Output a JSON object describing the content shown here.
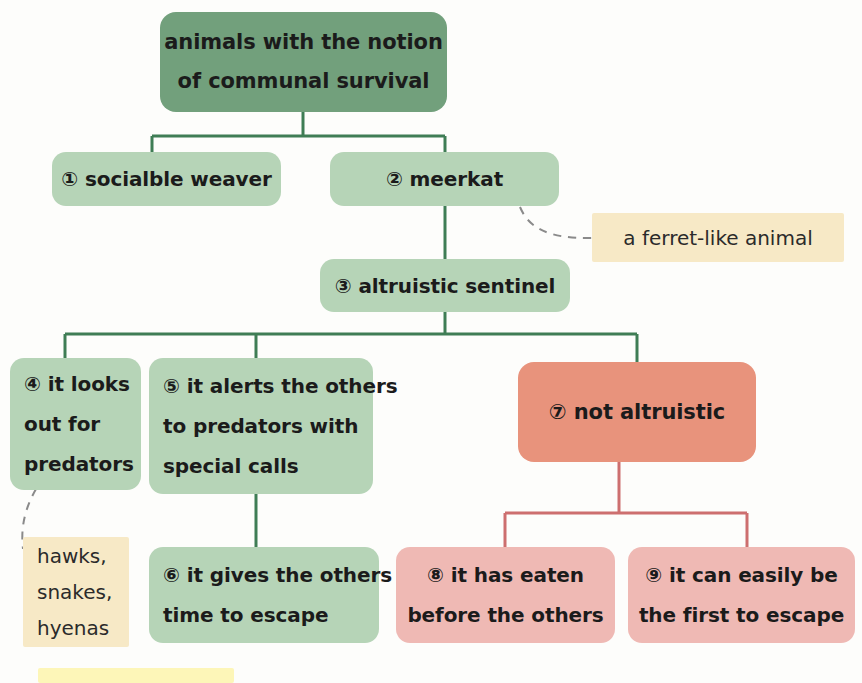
{
  "diagram": {
    "title_node": {
      "id": "root",
      "lines": [
        "animals with the notion",
        "of communal survival"
      ]
    },
    "nodes": [
      {
        "id": "n1",
        "number": "①",
        "lines": [
          "① socialble weaver"
        ],
        "color": "#b6d4b7"
      },
      {
        "id": "n2",
        "number": "②",
        "lines": [
          "② meerkat"
        ],
        "color": "#b6d4b7"
      },
      {
        "id": "n3",
        "number": "③",
        "lines": [
          "③ altruistic sentinel"
        ],
        "color": "#b6d4b7"
      },
      {
        "id": "n4",
        "number": "④",
        "lines": [
          "④ it looks",
          "out for",
          "predators"
        ],
        "color": "#b6d4b7"
      },
      {
        "id": "n5",
        "number": "⑤",
        "lines": [
          "⑤ it alerts the others",
          "to predators with",
          "special calls"
        ],
        "color": "#b6d4b7"
      },
      {
        "id": "n6",
        "number": "⑥",
        "lines": [
          "⑥ it gives the others",
          "time to escape"
        ],
        "color": "#b6d4b7"
      },
      {
        "id": "n7",
        "number": "⑦",
        "lines": [
          "⑦ not altruistic"
        ],
        "color": "#e8937c"
      },
      {
        "id": "n8",
        "number": "⑧",
        "lines": [
          "⑧ it has eaten",
          "before the others"
        ],
        "color": "#efb9b4"
      },
      {
        "id": "n9",
        "number": "⑨",
        "lines": [
          "⑨ it can easily be",
          "the first to escape"
        ],
        "color": "#efb9b4"
      }
    ],
    "notes": [
      {
        "id": "note-ferret",
        "lines": [
          "a ferret-like animal"
        ],
        "color": "#f7e9c6"
      },
      {
        "id": "note-predators",
        "lines": [
          "hawks,",
          "snakes,",
          "hyenas"
        ],
        "color": "#f7e9c6"
      }
    ],
    "colors": {
      "root_green": "#72a07c",
      "light_green": "#b6d4b7",
      "salmon": "#e8937c",
      "pink": "#efb9b4",
      "cream": "#f7e9c6",
      "yellow": "#fdf6b8",
      "green_edge": "#3f7d55",
      "red_edge": "#cd6f6f",
      "dashed_edge": "#8a8a8a",
      "background": "#fdfdfb"
    },
    "edges": [
      {
        "from": "root",
        "to": "n1",
        "style": "solid",
        "color": "#3f7d55"
      },
      {
        "from": "root",
        "to": "n2",
        "style": "solid",
        "color": "#3f7d55"
      },
      {
        "from": "n2",
        "to": "n3",
        "style": "solid",
        "color": "#3f7d55"
      },
      {
        "from": "n2",
        "to": "note-ferret",
        "style": "dashed",
        "color": "#8a8a8a"
      },
      {
        "from": "n3",
        "to": "n4",
        "style": "solid",
        "color": "#3f7d55"
      },
      {
        "from": "n3",
        "to": "n5",
        "style": "solid",
        "color": "#3f7d55"
      },
      {
        "from": "n3",
        "to": "n7",
        "style": "solid",
        "color": "#3f7d55"
      },
      {
        "from": "n4",
        "to": "note-predators",
        "style": "dashed",
        "color": "#8a8a8a"
      },
      {
        "from": "n5",
        "to": "n6",
        "style": "solid",
        "color": "#3f7d55"
      },
      {
        "from": "n7",
        "to": "n8",
        "style": "solid",
        "color": "#cd6f6f"
      },
      {
        "from": "n7",
        "to": "n9",
        "style": "solid",
        "color": "#cd6f6f"
      }
    ]
  }
}
